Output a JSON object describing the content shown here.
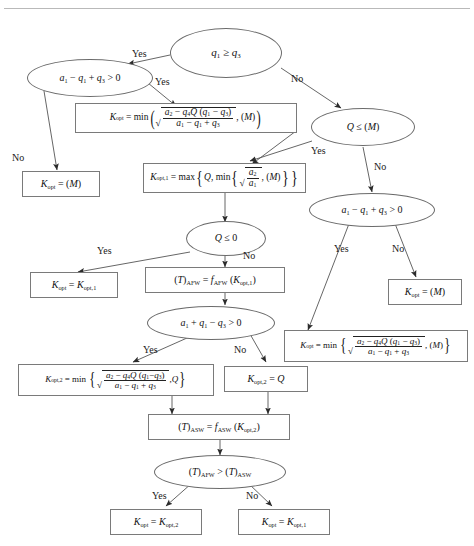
{
  "figure": {
    "kind": "flowchart",
    "title": "",
    "background": "#ffffff",
    "stroke_color": "#6b6b6b",
    "text_color": "#1a1a1a"
  },
  "nodes": {
    "d1": {
      "id": "d1",
      "shape": "ellipse",
      "text": "q₁ ≥ q₃"
    },
    "d2": {
      "id": "d2",
      "shape": "ellipse",
      "text": "a₁ − q₁ + q₃ > 0"
    },
    "p1": {
      "id": "p1",
      "shape": "rect",
      "text": "K_opt = min( √((a₂ − q₄Q(q₁ − q₃))/(a₁ − q₁ + q₃)), (M) )"
    },
    "t1": {
      "id": "t1",
      "shape": "rect",
      "text": "K_opt = (M)"
    },
    "d3": {
      "id": "d3",
      "shape": "ellipse",
      "text": "Q ≤ (M)"
    },
    "p2": {
      "id": "p2",
      "shape": "rect",
      "text": "K_opt,1 = max{ Q, min{ √(a₂/a₁), (M) } }"
    },
    "d4": {
      "id": "d4",
      "shape": "ellipse",
      "text": "a₁ − q₁ + q₃ > 0"
    },
    "t2": {
      "id": "t2",
      "shape": "rect",
      "text": "K_opt = (M)"
    },
    "p3": {
      "id": "p3",
      "shape": "rect",
      "text": "K_opt = min{ √((a₂ − q₄Q(q₁ − q₃))/(a₁ − q₁ + q₃)), (M) }"
    },
    "d5": {
      "id": "d5",
      "shape": "ellipse",
      "text": "Q ≤ 0"
    },
    "t3": {
      "id": "t3",
      "shape": "rect",
      "text": "K_opt = K_opt,1"
    },
    "p4": {
      "id": "p4",
      "shape": "rect",
      "text": "(T)_AFW = f_AFW(K_opt,1)"
    },
    "d6": {
      "id": "d6",
      "shape": "ellipse",
      "text": "a₁ + q₁ − q₃ > 0"
    },
    "p5": {
      "id": "p5",
      "shape": "rect",
      "text": "K_opt,2 = min{ √((a₂ − q₄Q(q₁ − q₃))/(a₁ − q₁ + q₃)), Q }"
    },
    "p6": {
      "id": "p6",
      "shape": "rect",
      "text": "K_opt,2 = Q"
    },
    "p7": {
      "id": "p7",
      "shape": "rect",
      "text": "(T)_ASW = f_ASW(K_opt,2)"
    },
    "d7": {
      "id": "d7",
      "shape": "ellipse",
      "text": "(T)_AFW > (T)_ASW"
    },
    "t4": {
      "id": "t4",
      "shape": "rect",
      "text": "K_opt = K_opt,2"
    },
    "t5": {
      "id": "t5",
      "shape": "rect",
      "text": "K_opt = K_opt,1"
    }
  },
  "edge_labels": {
    "d1_yes": "Yes",
    "d1_no": "No",
    "d2_yes": "Yes",
    "d2_no": "No",
    "d3_yes": "Yes",
    "d3_no": "No",
    "d4_yes": "Yes",
    "d4_no": "No",
    "d5_yes": "Yes",
    "d5_no": "No",
    "d6_yes": "Yes",
    "d6_no": "No",
    "d7_yes": "Yes",
    "d7_no": "No"
  },
  "symbols": {
    "K": "K",
    "opt": "opt",
    "opt1": "opt,1",
    "opt2": "opt,2",
    "M": "M",
    "Q": "Q",
    "min": "min",
    "max": "max",
    "AFW": "AFW",
    "ASW": "ASW",
    "f": "f",
    "T": "T",
    "ge": "≥",
    "le": "≤",
    "gt": ">",
    "minus": "−",
    "plus": "+",
    "eq": "="
  }
}
